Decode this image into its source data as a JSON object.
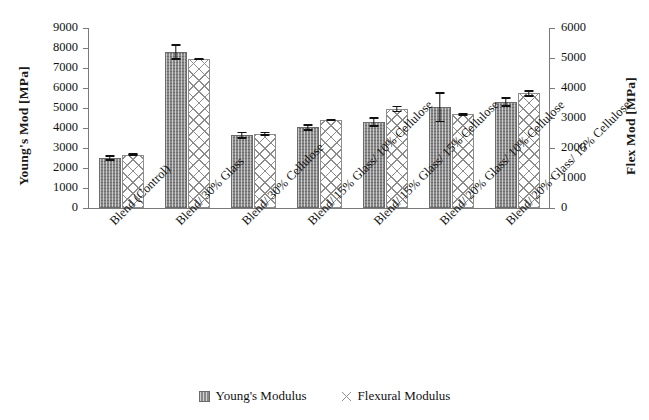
{
  "chart_data": {
    "type": "bar",
    "title": "",
    "xlabel": "",
    "ylabel": "Young's Mod [MPa]",
    "ylabel_right": "Flex Mod [MPa]",
    "ylim": [
      0,
      9000
    ],
    "ylim_right": [
      0,
      6000
    ],
    "yticks": [
      0,
      1000,
      2000,
      3000,
      4000,
      5000,
      6000,
      7000,
      8000,
      9000
    ],
    "yticks_right": [
      0,
      1000,
      2000,
      3000,
      4000,
      5000,
      6000
    ],
    "grid": false,
    "legend_position": "bottom",
    "categories": [
      "Blend (Control)",
      "Blend/ 30% Glass",
      "Blend/ 30% Cellulose",
      "Blend/ 15% Glass/ 10% Cellulose",
      "Blend/ 15% Glass/ 15% Cellulose",
      "Blend/ 20% Glass/ 10% Cellulose",
      "Blend/ 20% Glass/ 15% Cellulose"
    ],
    "series": [
      {
        "name": "Young's Modulus",
        "axis": "left",
        "values": [
          2500,
          7800,
          3630,
          4030,
          4300,
          5030,
          5300
        ],
        "errors": [
          130,
          400,
          180,
          160,
          250,
          750,
          250
        ]
      },
      {
        "name": "Flexural Modulus",
        "axis": "right",
        "values": [
          1780,
          4960,
          2470,
          2930,
          3300,
          3130,
          3820
        ],
        "errors": [
          40,
          40,
          70,
          40,
          110,
          50,
          110
        ]
      }
    ]
  },
  "axes": {
    "left_title": "Young's Mod [MPa]",
    "right_title": "Flex Mod [MPa]",
    "left_ticks": [
      "9000",
      "8000",
      "7000",
      "6000",
      "5000",
      "4000",
      "3000",
      "2000",
      "1000",
      "0"
    ],
    "right_ticks": [
      "6000",
      "5000",
      "4000",
      "3000",
      "2000",
      "1000",
      "0"
    ]
  },
  "legend": {
    "items": [
      {
        "label": "Young's Modulus",
        "swatch": "young-hatch-swatch",
        "color": "#8a8a8a"
      },
      {
        "label": "Flexural Modulus",
        "swatch": "flex-crosshatch-swatch",
        "color": "#8d8d8d"
      }
    ]
  }
}
